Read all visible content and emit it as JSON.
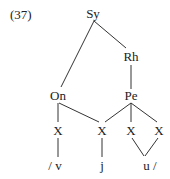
{
  "example_number": "(37)",
  "nodes": {
    "syllable": "Sy",
    "rhyme": "Rh",
    "onset": "On",
    "peak": "Pe",
    "x1": "X",
    "x2": "X",
    "x3": "X",
    "x4": "X"
  },
  "segments": {
    "v": "/ v",
    "j": "j",
    "u": "u /"
  },
  "colors": {
    "text": "#222222",
    "line": "#333333",
    "background": "#ffffff"
  }
}
